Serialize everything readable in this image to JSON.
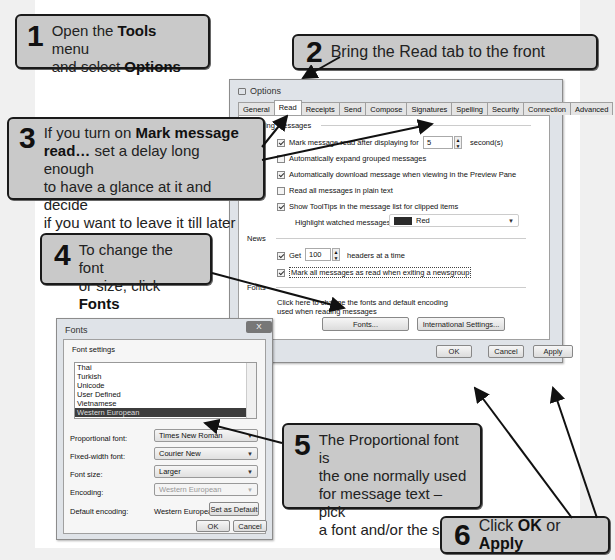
{
  "callouts": [
    {
      "num": "1",
      "parts": [
        "Open the ",
        "Tools",
        " menu",
        "and select ",
        "Options"
      ]
    },
    {
      "num": "2",
      "text": "Bring the Read tab to the front"
    },
    {
      "num": "3",
      "parts": [
        "If you turn on ",
        "Mark message",
        "read…",
        " set a delay long enough",
        "to have a glance at it and decide",
        "if you want to leave it till later"
      ]
    },
    {
      "num": "4",
      "parts": [
        "To change the font",
        "or size, click ",
        "Fonts"
      ]
    },
    {
      "num": "5",
      "lines": [
        "The Proportional font is",
        "the one normally used",
        "for message text – pick",
        "a font and/or the size"
      ]
    },
    {
      "num": "6",
      "parts": [
        "Click ",
        "OK",
        " or ",
        "Apply"
      ]
    }
  ],
  "options_dialog": {
    "title": "Options",
    "tabs": [
      "General",
      "Read",
      "Receipts",
      "Send",
      "Compose",
      "Signatures",
      "Spelling",
      "Security",
      "Connection",
      "Advanced"
    ],
    "active_tab": "Read",
    "sections": {
      "reading": "Reading Messages",
      "news": "News",
      "fonts": "Fonts"
    },
    "reading_items": [
      {
        "label": "Mark message read after displaying for",
        "checked": true
      },
      {
        "label": "Automatically expand grouped messages",
        "checked": false
      },
      {
        "label": "Automatically download message when viewing in the Preview Pane",
        "checked": true
      },
      {
        "label": "Read all messages in plain text",
        "checked": false
      },
      {
        "label": "Show ToolTips in the message list for clipped items",
        "checked": true
      }
    ],
    "delay_value": "5",
    "delay_unit": "second(s)",
    "highlight_label": "Highlight watched messages:",
    "highlight_value": "Red",
    "highlight_color": "#2a2a2a",
    "news_get_label": "Get",
    "news_get_value": "100",
    "news_headers_label": "headers at a time",
    "news_mark_label": "Mark all messages as read when exiting a newsgroup",
    "fonts_desc_1": "Click here to change the fonts and default encoding",
    "fonts_desc_2": "used when reading messages",
    "fonts_button": "Fonts...",
    "intl_button": "International Settings...",
    "ok": "OK",
    "cancel": "Cancel",
    "apply": "Apply"
  },
  "fonts_dialog": {
    "title": "Fonts",
    "close": "X",
    "group": "Font settings",
    "list": [
      "Thai",
      "Turkish",
      "Unicode",
      "User Defined",
      "Vietnamese",
      "Western European"
    ],
    "selected": "Western European",
    "proportional_label": "Proportional font:",
    "proportional_value": "Times New Roman",
    "fixed_label": "Fixed-width font:",
    "fixed_value": "Courier New",
    "size_label": "Font size:",
    "size_value": "Larger",
    "encoding_label": "Encoding:",
    "encoding_value": "Western European",
    "default_label": "Default encoding:",
    "default_value": "Western European",
    "set_default": "Set as Default",
    "ok": "OK",
    "cancel": "Cancel"
  }
}
